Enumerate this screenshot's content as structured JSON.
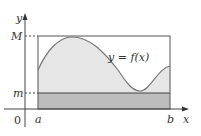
{
  "figure": {
    "axis_labels": {
      "x": "x",
      "y": "y",
      "origin": "0"
    },
    "tick_labels": {
      "M": "M",
      "m": "m",
      "a": "a",
      "b": "b"
    },
    "curve_label": "y = f(x)",
    "colors": {
      "axis": "#444444",
      "box_outline": "#555555",
      "curve": "#777777",
      "upper_fill": "#e6e6e6",
      "lower_fill": "#bdbdbd",
      "dashed_guide": "#444444",
      "background": "#ffffff"
    }
  }
}
